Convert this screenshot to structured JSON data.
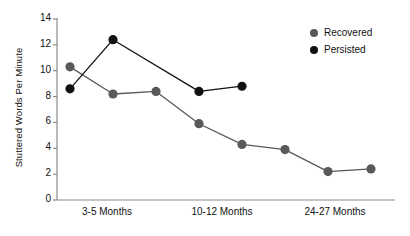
{
  "chart_data": {
    "type": "line",
    "title": "",
    "xlabel": "",
    "ylabel": "Stuttered Words Per Minute",
    "ylim": [
      0,
      14
    ],
    "yticks": [
      0,
      2,
      4,
      6,
      8,
      10,
      12,
      14
    ],
    "ytick_labels": [
      "0",
      "2",
      "4",
      "6",
      "8",
      "10",
      "12",
      "14"
    ],
    "xtick_labels": [
      "3-5 Months",
      "10-12 Months",
      "24-27 Months"
    ],
    "grid": false,
    "legend_position": "top-right",
    "x_positions": [
      0,
      1,
      2,
      3,
      4,
      5,
      6,
      7
    ],
    "series": [
      {
        "name": "Recovered",
        "color": "#595959",
        "x": [
          0,
          1,
          2,
          3,
          4,
          5,
          6,
          7
        ],
        "values": [
          10.3,
          8.2,
          8.4,
          5.9,
          4.3,
          3.9,
          2.2,
          2.4
        ]
      },
      {
        "name": "Persisted",
        "color": "#111111",
        "x": [
          0,
          1,
          3,
          4
        ],
        "values": [
          8.6,
          12.4,
          8.4,
          8.8
        ]
      }
    ]
  },
  "legend": {
    "items": [
      {
        "label": "Recovered",
        "color": "#595959"
      },
      {
        "label": "Persisted",
        "color": "#111111"
      }
    ]
  },
  "axes": {
    "axis_color": "#8c8c8c",
    "text_color": "#111111"
  }
}
